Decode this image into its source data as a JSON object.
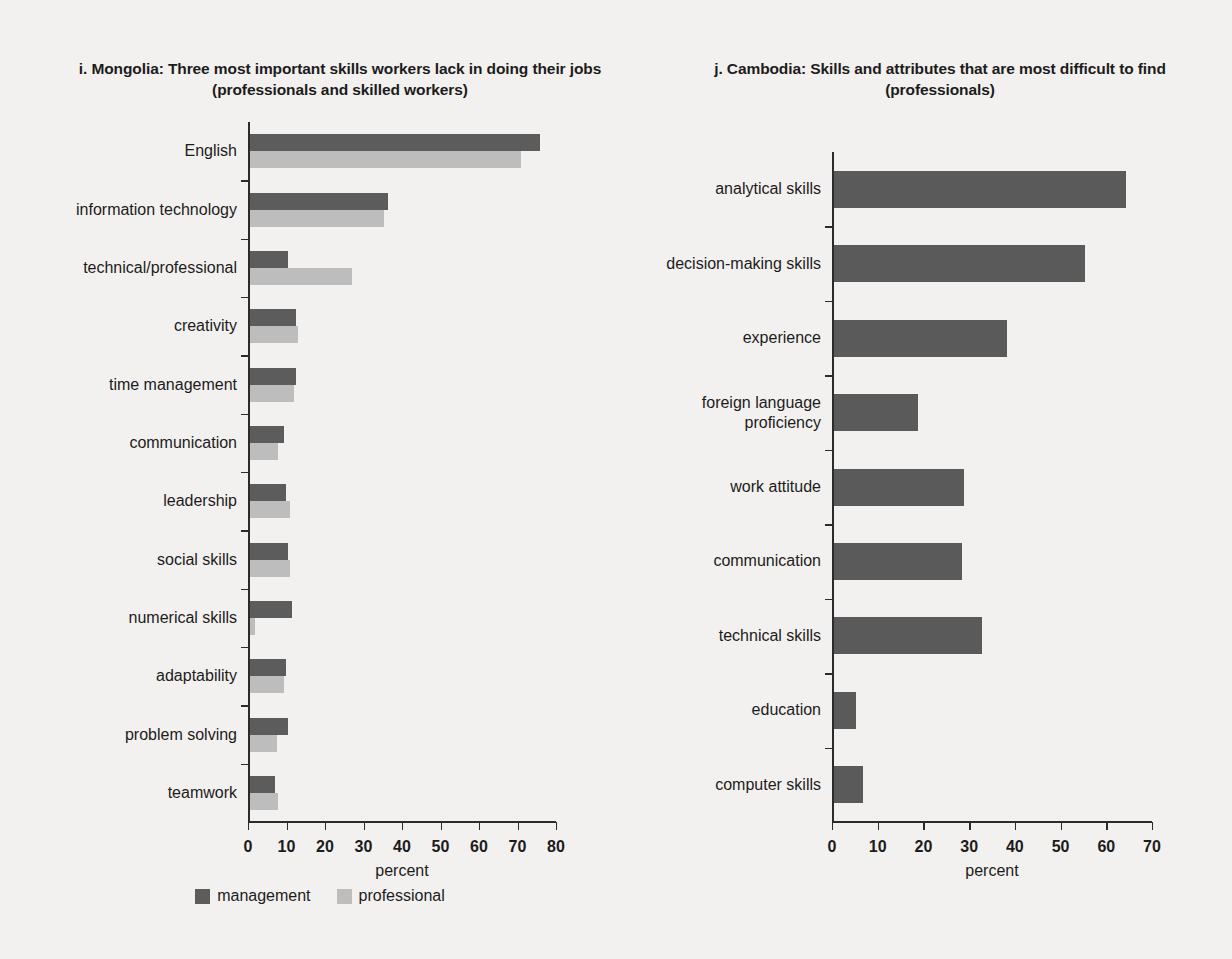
{
  "figure": {
    "background_color": "#f3f1ef",
    "management_color": "#5c5c5c",
    "professional_color": "#bdbdbd"
  },
  "legend": {
    "items": [
      {
        "label": "management",
        "color": "#5c5c5c"
      },
      {
        "label": "professional",
        "color": "#bdbdbd"
      }
    ]
  },
  "chart_data": [
    {
      "id": "mongolia",
      "type": "bar",
      "orientation": "horizontal",
      "title": "i. Mongolia: Three most important skills workers lack in doing their jobs (professionals and skilled workers)",
      "xlabel": "percent",
      "ylabel": "",
      "xlim": [
        0,
        80
      ],
      "xticks": [
        0,
        10,
        20,
        30,
        40,
        50,
        60,
        70,
        80
      ],
      "xtick_labels": [
        "0",
        "10",
        "20",
        "30",
        "40",
        "50",
        "60",
        "70",
        "80"
      ],
      "grid": false,
      "legend_position": "bottom-center",
      "categories": [
        "English",
        "information technology",
        "technical/professional",
        "creativity",
        "time management",
        "communication",
        "leadership",
        "social skills",
        "numerical skills",
        "adaptability",
        "problem solving",
        "teamwork"
      ],
      "series": [
        {
          "name": "management",
          "color": "#5c5c5c",
          "values": [
            75.5,
            36.0,
            10.0,
            12.0,
            12.0,
            9.0,
            9.5,
            10.0,
            11.0,
            9.5,
            10.0,
            6.5
          ]
        },
        {
          "name": "professional",
          "color": "#bdbdbd",
          "values": [
            70.5,
            35.0,
            26.5,
            12.5,
            11.5,
            7.5,
            10.5,
            10.5,
            1.5,
            9.0,
            7.0,
            7.5
          ]
        }
      ]
    },
    {
      "id": "cambodia",
      "type": "bar",
      "orientation": "horizontal",
      "title": "j. Cambodia: Skills and attributes that are most difficult to find (professionals)",
      "xlabel": "percent",
      "ylabel": "",
      "xlim": [
        0,
        70
      ],
      "xticks": [
        0,
        10,
        20,
        30,
        40,
        50,
        60,
        70
      ],
      "xtick_labels": [
        "0",
        "10",
        "20",
        "30",
        "40",
        "50",
        "60",
        "70"
      ],
      "grid": false,
      "legend_position": "none",
      "categories": [
        "analytical skills",
        "decision-making skills",
        "experience",
        "foreign language\nproficiency",
        "work attitude",
        "communication",
        "technical skills",
        "education",
        "computer skills"
      ],
      "series": [
        {
          "name": "professionals",
          "color": "#5a5a5a",
          "values": [
            64.0,
            55.0,
            38.0,
            18.5,
            28.5,
            28.0,
            32.5,
            5.0,
            6.5
          ]
        }
      ]
    }
  ]
}
